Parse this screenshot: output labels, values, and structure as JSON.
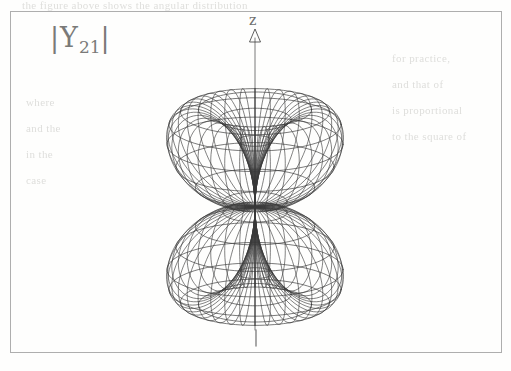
{
  "figure": {
    "caption_label": "|Y",
    "caption_sub": "21",
    "caption_close": "|",
    "axis_z_label": "z",
    "line_color": "#3a3a3a",
    "frame_color": "#aeaeae",
    "paper_color": "#fefefd",
    "ghost_color": "#d9d9d6"
  },
  "ghost_text": {
    "top": "the figure above shows the angular distribution",
    "r1": "for practice,",
    "r2": "and that of",
    "r3": "is proportional",
    "r4": "to the square of",
    "l1": "where",
    "l2": "and the",
    "l3": "in the",
    "l4": "case"
  },
  "chart_data": {
    "type": "surface-3d-wireframe",
    "title": "|Y21|",
    "function": "r(theta) = |sin(theta) * cos(theta)|",
    "l": 2,
    "m": 1,
    "axes": {
      "z": {
        "label": "z",
        "direction": "up",
        "arrowhead": "hollow-triangle",
        "has_lower_tick": true
      }
    },
    "lobes": [
      {
        "name": "upper-lobe",
        "sign": "+z",
        "max_theta_deg": 45
      },
      {
        "name": "lower-lobe",
        "sign": "-z",
        "max_theta_deg": 135
      }
    ],
    "node_plane": "theta = 90 deg (xy-plane)",
    "mesh": {
      "meridians": 36,
      "parallels_per_lobe": 11
    },
    "geometry": {
      "center_x": 255,
      "waist_y": 207,
      "top_y": 73,
      "bottom_y": 340,
      "left_x": 145,
      "right_x": 366,
      "view_elevation_deg": 18
    },
    "grid": false,
    "legend": false
  }
}
